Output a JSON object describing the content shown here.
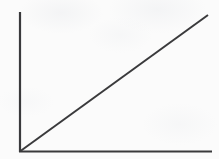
{
  "figure": {
    "title": "",
    "subtitle": "",
    "background_color": "#fbfbfb",
    "stroke_color": "#3a3a3c",
    "width": 219,
    "height": 159
  },
  "chart_data": {
    "type": "line",
    "title": "",
    "subtitle": "",
    "xlabel": "",
    "ylabel": "",
    "xlim": [
      0,
      100
    ],
    "ylim": [
      0,
      100
    ],
    "grid": false,
    "legend": null,
    "legend_position": "none",
    "xticks": [],
    "yticks": [],
    "xticklabels": [],
    "yticklabels": [],
    "annotations": [],
    "series": [
      {
        "name": "",
        "color": "#3a3a3c",
        "line_width": 2,
        "style": "solid",
        "markers": "none",
        "x": [
          0,
          100
        ],
        "y": [
          0,
          100
        ],
        "slope": 1,
        "intercept": 0
      }
    ],
    "axes": {
      "y_axis": {
        "label": "",
        "color": "#3a3a3c",
        "line_width": 2,
        "arrowhead": false,
        "ticks": false
      },
      "x_axis": {
        "label": "",
        "color": "#3a3a3c",
        "line_width": 2,
        "arrowhead": false,
        "ticks": false
      }
    }
  },
  "geometry": {
    "origin_x": 20,
    "origin_y": 151.5,
    "y_axis_top": 12,
    "x_axis_right": 212,
    "line_end_x": 208,
    "line_end_y": 15
  }
}
